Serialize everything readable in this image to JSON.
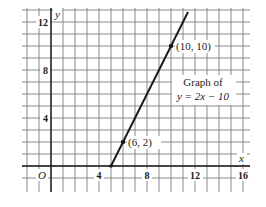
{
  "chart_data": {
    "type": "line",
    "title": "Graph of y = 2x − 10",
    "equation": "y = 2x − 10",
    "xlabel": "x",
    "ylabel": "y",
    "xlim": [
      -2,
      16
    ],
    "ylim": [
      -2,
      13
    ],
    "grid": true,
    "grid_step": 1,
    "x_ticks": [
      {
        "value": 4,
        "label": "4"
      },
      {
        "value": 8,
        "label": "8"
      },
      {
        "value": 12,
        "label": "12"
      },
      {
        "value": 16,
        "label": "16"
      }
    ],
    "y_ticks": [
      {
        "value": 4,
        "label": "4"
      },
      {
        "value": 8,
        "label": "8"
      },
      {
        "value": 12,
        "label": "12"
      }
    ],
    "origin_label": "O",
    "series": [
      {
        "name": "y = 2x − 10",
        "x": [
          5,
          11.4
        ],
        "y": [
          0,
          12.8
        ]
      }
    ],
    "points": [
      {
        "x": 6,
        "y": 2,
        "label": "(6, 2)"
      },
      {
        "x": 10,
        "y": 10,
        "label": "(10, 10)"
      }
    ],
    "annotations": [
      {
        "text_line1": "Graph of",
        "text_line2": "y = 2x − 10"
      }
    ]
  },
  "labels": {
    "x_axis": "x",
    "y_axis": "y",
    "origin": "O",
    "tick_x_4": "4",
    "tick_x_8": "8",
    "tick_x_12": "12",
    "tick_x_16": "16",
    "tick_y_4": "4",
    "tick_y_8": "8",
    "tick_y_12": "12",
    "point_a": "(6, 2)",
    "point_b": "(10, 10)",
    "caption_line1": "Graph of",
    "caption_line2": "y = 2x − 10"
  }
}
